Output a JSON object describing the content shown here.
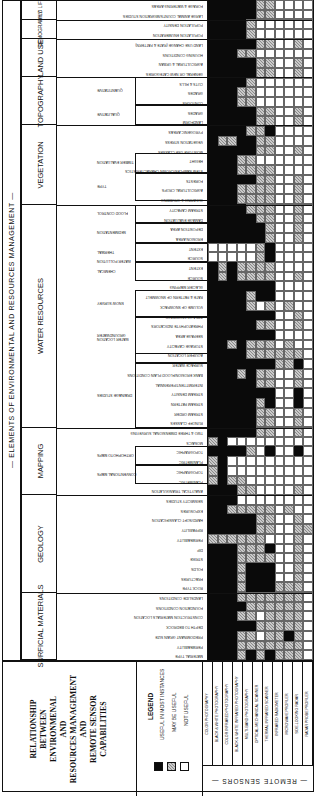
{
  "title_lines": [
    "RELATIONSHIP",
    "BETWEEN",
    "ENVIRONMENAL",
    "AND",
    "RESOURCES MANAGEMENT",
    "AND",
    "REMOTE SENSOR",
    "CAPABILITIES"
  ],
  "elements_heading": "— ELEMENTS OF ENVIRONMENTAL AND RESOURCES MANAGEMENT —",
  "sensors_heading": "— REMOTE SENSORS —",
  "legend": {
    "heading": "LEGEND",
    "items": [
      {
        "label": "USEFUL IN MOST INSTANCES",
        "code": "B",
        "color": "#0a0a0a"
      },
      {
        "label": "MAY BE USEFUL",
        "code": "H",
        "color": "#a8a8a8"
      },
      {
        "label": "NOT USEFUL",
        "code": "W",
        "color": "#ffffff"
      }
    ]
  },
  "sensors": [
    "COLOR PHOTOGRAPHY",
    "BLACK & WHITE PHOTOGRAPHY",
    "COLOR INFRARED PHOTOGRAPHY",
    "BLACK & WHITE INFRARED PHOTOGRAPHY",
    "MULTI-BAND PHOTOGRAPHY",
    "OPTICAL-MECHANICAL SCANNER",
    "THERMAL INFRARED SCANNER",
    "INFRARED RADIOMETER",
    "MICROWAVE PROFILER",
    "SIDE-LOOKING RADAR",
    "RADAR PROBE PROFILER"
  ],
  "categories": [
    {
      "name": "WILD LIFE",
      "top": 0,
      "height": 20
    },
    {
      "name": "DEMOGRAPHY",
      "top": 20,
      "height": 19
    },
    {
      "name": "LAND USE",
      "top": 39,
      "height": 38
    },
    {
      "name": "TOPOGRAPHY",
      "top": 77,
      "height": 48
    },
    {
      "name": "VEGETATION",
      "top": 125,
      "height": 80
    },
    {
      "name": "WATER RESOURCES",
      "top": 205,
      "height": 223
    },
    {
      "name": "MAPPING",
      "top": 428,
      "height": 67
    },
    {
      "name": "GEOLOGY",
      "top": 495,
      "height": 98
    },
    {
      "name": "SURFICIAL MATERIALS",
      "top": 593,
      "height": 67
    }
  ],
  "subgroups": [
    {
      "name": "QUANTITATIVE",
      "top": 77,
      "height": 28
    },
    {
      "name": "QUALITATIVE",
      "top": 105,
      "height": 20
    },
    {
      "name": "TIMBER EVALUATION",
      "top": 153,
      "height": 20
    },
    {
      "name": "TYPE",
      "top": 173,
      "height": 28
    },
    {
      "name": "FLOOD CONTROL",
      "top": 205,
      "height": 18
    },
    {
      "name": "SEDIMENTATION",
      "top": 223,
      "height": 20
    },
    {
      "name": "WATER POLLUTION",
      "top": 243,
      "height": 38
    },
    {
      "name": "THERMAL",
      "top": 243,
      "height": 19
    },
    {
      "name": "CHEMICAL",
      "top": 262,
      "height": 19
    },
    {
      "name": "SNOW SURVEY",
      "top": 290,
      "height": 27
    },
    {
      "name": "WATER LOCATION",
      "top": 317,
      "height": 46
    },
    {
      "name": "GROUNDWATER",
      "top": 317,
      "height": 37
    },
    {
      "name": "DRAINAGE STUDIES",
      "top": 363,
      "height": 65
    },
    {
      "name": "ORTHOPHOTO MAPS",
      "top": 446,
      "height": 19
    },
    {
      "name": "CONVENTIONAL MAPS",
      "top": 465,
      "height": 19
    }
  ],
  "rows": [
    {
      "label": "FORAGE & WATERING AREAS",
      "v": "BBBBBHHWWWW"
    },
    {
      "label": "LARGE ANIMAL COUNTS/MIGRATION STUDIES",
      "v": "BBBBBHHWWWW"
    },
    {
      "label": "POPULATION DENSITY",
      "v": "BBBBHWWWWWW"
    },
    {
      "label": "POPULATION ENUMERATION",
      "v": "BBBBHWWWWWW"
    },
    {
      "label": "LAND USE CHANGE (RATE & PATTERN)",
      "v": "BBBBBHHWWHW"
    },
    {
      "label": "HOUSING CONDITIONS",
      "v": "BBBHHWWWWWW"
    },
    {
      "label": "AGRICULTURAL & URBAN",
      "v": "BBBBBHHWWHW"
    },
    {
      "label": "GENERAL OR NEW CATEGORIES",
      "v": "BBBBBHHWWHW"
    },
    {
      "label": "CUTS & FILLS",
      "v": "BBBBHWWWWWW"
    },
    {
      "label": "GRADES",
      "v": "BBBHHWWWWWW"
    },
    {
      "label": "CONTOURS",
      "v": "BBBHHWWWWWW"
    },
    {
      "label": "GRADES",
      "v": "BBBBBHHWWHW"
    },
    {
      "label": "LANDFORM",
      "v": "BBBBBHHWWHW"
    },
    {
      "label": "PYROGENIC AREAS",
      "v": "BBBBHHBWWWW"
    },
    {
      "label": "VEGETATION STRESS",
      "v": "BHHBBHHWWWW"
    },
    {
      "label": "MOISTURE USE CLASSES",
      "v": "BBBBBHHWWHW"
    },
    {
      "label": "HEIGHT",
      "v": "BBBHHWWWWWW"
    },
    {
      "label": "STEM SAMPLES/CROWN CHARACTERISTICS",
      "v": "BBBHHHHWWWW"
    },
    {
      "label": "FORESTS",
      "v": "BBBBBHHWWHW"
    },
    {
      "label": "AGRICULTURAL CROPS",
      "v": "BBBHHHHWWHW"
    },
    {
      "label": "CLEARING & GRUBBING",
      "v": "BBBHHHHWWHW"
    },
    {
      "label": "STREAM CAPACITY",
      "v": "BBBBHHHWWHW"
    },
    {
      "label": "DAMAGE EVALUATION",
      "v": "BBBBBHHWWHW"
    },
    {
      "label": "DEPOSITION AREA",
      "v": "BBBBBBHWWHW"
    },
    {
      "label": "EROSION AREA",
      "v": "BBBBBBHWWHW"
    },
    {
      "label": "EXTENT",
      "v": "WWWWWHBWWWW"
    },
    {
      "label": "SOURCE",
      "v": "WWWWWHBWWWW"
    },
    {
      "label": "EXTENT",
      "v": "BHBHHHHWWWW"
    },
    {
      "label": "SOURCE",
      "v": "BHBHHHHWWHW"
    },
    {
      "label": "GLACIER MAPPING",
      "v": "BBBBBBBWWWW"
    },
    {
      "label": "RATE & PATTERN OF SNOWMELT",
      "v": "BBBBHBBWWWW"
    },
    {
      "label": "VOLUME OF SNOWPACK",
      "v": "BBBBHWHWHWW"
    },
    {
      "label": "AREA OF SNOWPACK",
      "v": "BBBBBBBWWHW"
    },
    {
      "label": "PHREATOPHYTE INDICATORS",
      "v": "BBBBBHHWWHW"
    },
    {
      "label": "SEEPAGE AREA",
      "v": "BBBBBBBWWWW"
    },
    {
      "label": "STORAGE CAPACITY",
      "v": "BBHBHHHWHWW"
    },
    {
      "label": "AQUIFER LOCATION",
      "v": "BBBBHHHHHHW"
    },
    {
      "label": "SURFACE WATER",
      "v": "BBBBBBBHHBW"
    },
    {
      "label": "BANK EROSION/FLOOD PLAIN CONDITIONS",
      "v": "BBBHBHHWWHW"
    },
    {
      "label": "INTERMITTENT/PERENNIAL",
      "v": "BBBBBHHWWHW"
    },
    {
      "label": "STREAM DENSITY",
      "v": "BBBBBBBWWBW"
    },
    {
      "label": "STREAM PATTERN",
      "v": "BBBBBHBWWBW"
    },
    {
      "label": "STREAM ORDER",
      "v": "BBBBBHHWWHW"
    },
    {
      "label": "RUNOFF CLASSES",
      "v": "BBBBBHHWWHW"
    },
    {
      "label": "TWO & THREE DIMENSIONAL SURVEYING",
      "v": "BBBBBHHWWHW"
    },
    {
      "label": "MOSAICS",
      "v": "HBWWWWWWWWW"
    },
    {
      "label": "TOPOGRAPHIC",
      "v": "BBBBHWBWWBW"
    },
    {
      "label": "PLANIMETRIC",
      "v": "HBWWWWWWWWW"
    },
    {
      "label": "TOPOGRAPHIC",
      "v": "HBWWWWWWWWW"
    },
    {
      "label": "PLANIMETRIC",
      "v": "HBHHWWWWWWW"
    },
    {
      "label": "ANALYTICAL TRIANGULATION",
      "v": "BBBHHWWWWHW"
    },
    {
      "label": "SEISMICITY STUDIES",
      "v": "BBBWWWWWWWW"
    },
    {
      "label": "EXPOSURES",
      "v": "BBHHHHHWHWW"
    },
    {
      "label": "HARD/SOFT CLASSIFICATION",
      "v": "BBBBBHHWWHW"
    },
    {
      "label": "RIPPABILITY",
      "v": "BBBBBHHWWHH"
    },
    {
      "label": "PERMEABILITY",
      "v": "HHHHHHWWWHW"
    },
    {
      "label": "DIP",
      "v": "BBBHHHBWWHW"
    },
    {
      "label": "STRIKE",
      "v": "BBBHHHHWWHW"
    },
    {
      "label": "FOLDS",
      "v": "BBBHBBBWWHW"
    },
    {
      "label": "FRACTURES",
      "v": "BBBHBBBWWHW"
    },
    {
      "label": "ROCK TYPE",
      "v": "BBBHBBBHHHW"
    },
    {
      "label": "LANDSLIDE CONDITIONS",
      "v": "BBBHHHHHHHW"
    },
    {
      "label": "FOUNDATION CONDITIONS",
      "v": "BBBBHHHHHHW"
    },
    {
      "label": "CONSTRUCTION MATERIALS LOCATION",
      "v": "BBBHHWHHHHW"
    },
    {
      "label": "DEPTH TO BEDROCK",
      "v": "BBBBBHHHHHW"
    },
    {
      "label": "PREDOMINANT GRAIN SIZE",
      "v": "BBBHHWHHBHW"
    },
    {
      "label": "PERMEABILITY",
      "v": "BBBHHHHHHHW"
    },
    {
      "label": "MATERIAL TYPE",
      "v": "BBBHBHBHHHW"
    }
  ]
}
